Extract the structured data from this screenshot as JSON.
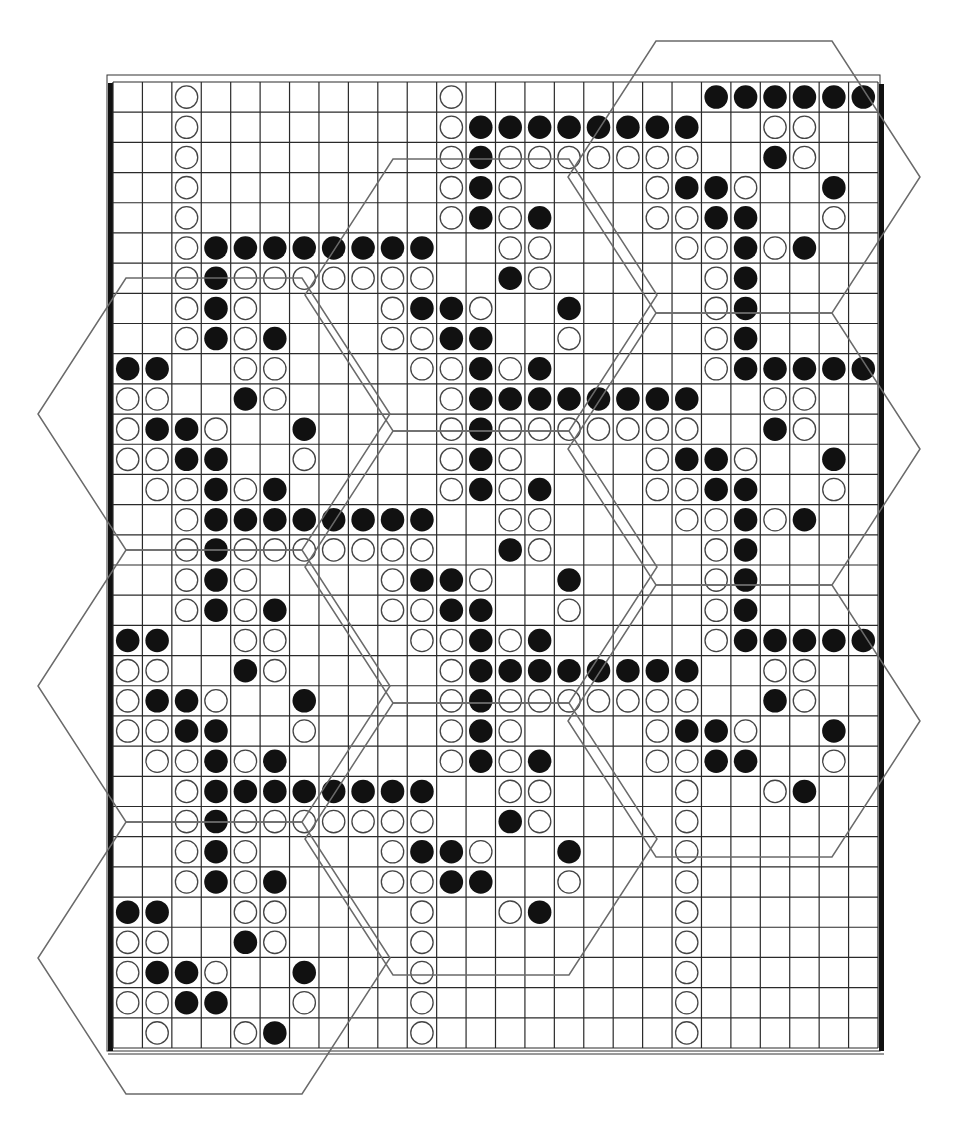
{
  "figure": {
    "title": "Grid pattern of black and white stones with hexagonal tiling overlay",
    "legend": {
      "b": "black stone",
      "w": "white stone",
      ".": "empty cell"
    },
    "grid_rows": 32,
    "grid_cols": 26,
    "colors": {
      "grid_line": "#2a2a2a",
      "black_stone": "#111111",
      "white_stone_fill": "#ffffff",
      "white_stone_stroke": "#444444",
      "hex_line": "#6a6a6a",
      "frame": "#111111"
    },
    "cells": [
      "..w........w........bbbbbb",
      "..w........wbbbbbbbb..ww..",
      "..w........wbwwwwwww..bw..",
      "..w........wbw....wbbw..b.",
      "..w........wbwb...wwbb..w.",
      "..wbbbbbbbb..ww....wwbwb..",
      "..wbwwwwwww..bw.....wb....",
      "..wbw....wbbw..b....wb....",
      "..wbwb...wwbb..w....wb....",
      "bb..ww....wwbwb.....wbbbbb",
      "ww..bw.....wbbbbbbbb..ww..",
      "wbbw..b....wbwwwwwww..bw..",
      "wwbb..w....wbw....wbbw..b.",
      ".wwbwb.....wbwb...wwbb..w.",
      "..wbbbbbbbb..ww....wwbwb..",
      "..wbwwwwwww..bw.....wb....",
      "..wbw....wbbw..b....wb....",
      "..wbwb...wwbb..w....wb....",
      "bb..ww....wwbwb.....wbbbbb",
      "ww..bw.....wbbbbbbbb..ww..",
      "wbbw..b....wbwwwwwww..bw..",
      "wwbb..w....wbw....wbbw..b.",
      ".wwbwb.....wbwb...wwbb..w.",
      "..wbbbbbbbb..ww....w..wb..",
      "..wbwwwwwww..bw....w......",
      "..wbw....wbbw..b...w......",
      "..wbwb...wwbb..w...w......",
      "bb..ww....w..wb....w......",
      "ww..bw....w........w......",
      "wbbw..b...w........w......",
      "wwbb..w...w........w......",
      ".w..wb....w........w......"
    ],
    "hexagons": [
      {
        "column": "A",
        "index": 0
      },
      {
        "column": "A",
        "index": 1
      },
      {
        "column": "A",
        "index": 2
      },
      {
        "column": "B",
        "index": 0
      },
      {
        "column": "B",
        "index": 1
      },
      {
        "column": "B",
        "index": 2
      },
      {
        "column": "C",
        "index": 0
      },
      {
        "column": "C",
        "index": 1
      },
      {
        "column": "C",
        "index": 2
      }
    ]
  }
}
